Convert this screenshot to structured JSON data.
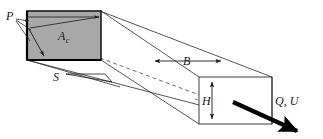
{
  "figure": {
    "labels": {
      "perimeter": "P",
      "area_base": "A",
      "area_sub": "c",
      "slope": "S",
      "width": "B",
      "depth": "H",
      "discharge_velocity": "Q, U"
    },
    "colors": {
      "cross_section_fill": "#a8a8a8",
      "stroke": "#1a1a1a",
      "thin_stroke": "#2b2b2b",
      "background": "#ffffff"
    }
  }
}
